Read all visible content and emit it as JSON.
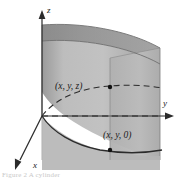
{
  "figure": {
    "kind": "3d-surface-diagram",
    "background_color": "#ffffff",
    "caption": "Figure 2 A cylinder"
  },
  "axes": {
    "z": {
      "label": "z",
      "icon": "arrow-up-icon"
    },
    "y": {
      "label": "y",
      "icon": "arrow-right-icon"
    },
    "x": {
      "label": "x",
      "icon": "arrow-down-left-icon"
    },
    "color": "#2b2b2b",
    "origin": {
      "x": 42,
      "y": 116
    }
  },
  "points": [
    {
      "id": "point-upper",
      "label": "(x, y, z)",
      "marker": "filled-dot",
      "coords": {
        "x": 110,
        "y": 87
      }
    },
    {
      "id": "point-lower",
      "label": "(x, y, 0)",
      "marker": "filled-dot",
      "coords": {
        "x": 110,
        "y": 143
      }
    }
  ],
  "surface": {
    "name": "cylinder-surface",
    "fill_light": "#b9b9b9",
    "fill_mid": "#a8a8a8",
    "fill_dark": "#8f8f8f",
    "fill_darkest": "#848484",
    "edge_color": "#6f6f6f"
  },
  "curves": [
    {
      "name": "base-trace-curve",
      "style": "solid",
      "color": "#2b2b2b"
    },
    {
      "name": "upper-trace-curve",
      "style": "dashed",
      "color": "#2b2b2b"
    },
    {
      "name": "horizontal-projection-line",
      "style": "dashed",
      "color": "#2b2b2b"
    },
    {
      "name": "vertical-connector-line",
      "style": "solid",
      "color": "#7a7a7a"
    }
  ]
}
